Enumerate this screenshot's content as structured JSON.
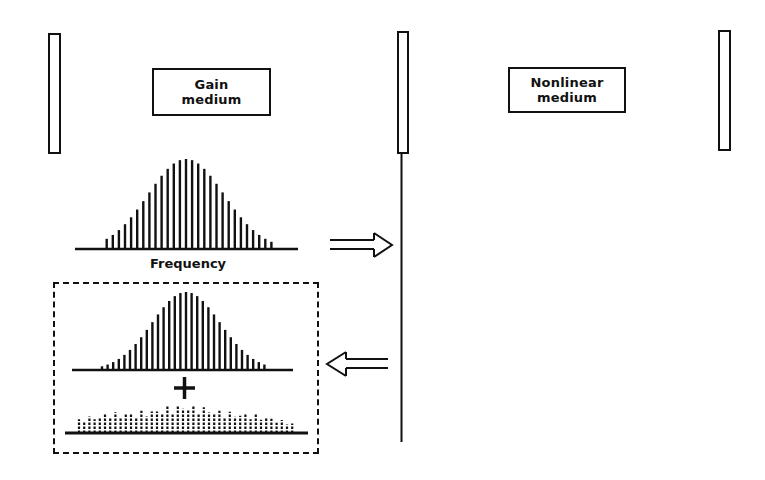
{
  "diagram": {
    "gain_medium": {
      "line1": "Gain",
      "line2": "medium"
    },
    "nonlinear_medium": {
      "line1": "Nonlinear",
      "line2": "medium"
    },
    "frequency_label": "Frequency",
    "plus_sign": "+",
    "arrows": {
      "forward": "right-arrow",
      "backward": "left-arrow"
    },
    "colors": {
      "ink": "#111111",
      "background": "#ffffff"
    }
  },
  "spectra": {
    "top": {
      "center_x": 186,
      "baseline_y": 249,
      "peak_height": 90,
      "sigma": 38,
      "spacing": 6.1,
      "count": 29,
      "x_start": 75,
      "x_end": 298
    },
    "inner": {
      "center_x": 186,
      "baseline_y": 370,
      "peak_height": 78,
      "sigma": 34,
      "spacing": 5.6,
      "count": 33,
      "x_start": 72,
      "x_end": 293
    },
    "noise": {
      "baseline_y": 433,
      "x_start": 65,
      "x_end": 308,
      "spacing": 5.2
    }
  }
}
